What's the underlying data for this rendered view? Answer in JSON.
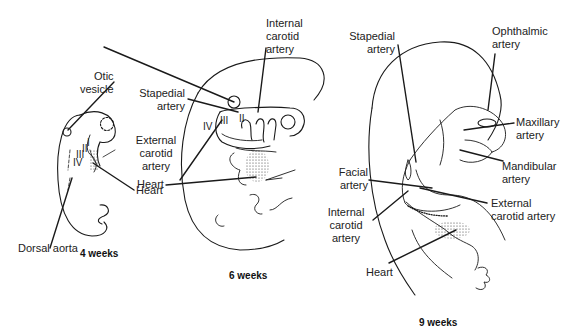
{
  "panels": [
    {
      "id": "4w",
      "caption": "4 weeks",
      "labels": {
        "otic_vesicle": [
          "Otic",
          "vesicle"
        ],
        "dorsal_aorta": "Dorsal aorta",
        "heart": "Heart"
      },
      "arch_numerals": [
        "I",
        "II",
        "III",
        "IV"
      ]
    },
    {
      "id": "6w",
      "caption": "6 weeks",
      "labels": {
        "internal_carotid": [
          "Internal",
          "carotid",
          "artery"
        ],
        "stapedial": [
          "Stapedial",
          "artery"
        ],
        "external_carotid": [
          "External",
          "carotid",
          "artery"
        ],
        "heart": "Heart"
      },
      "arch_numerals": [
        "II",
        "III",
        "IV"
      ]
    },
    {
      "id": "9w",
      "caption": "9 weeks",
      "labels": {
        "stapedial": [
          "Stapedial",
          "artery"
        ],
        "ophthalmic": [
          "Ophthalmic",
          "artery"
        ],
        "maxillary": [
          "Maxillary",
          "artery"
        ],
        "facial": [
          "Facial",
          "artery"
        ],
        "mandibular": [
          "Mandibular",
          "artery"
        ],
        "external_carotid": [
          "External",
          "carotid artery"
        ],
        "internal_carotid": [
          "Internal",
          "carotid",
          "artery"
        ],
        "heart": "Heart"
      }
    }
  ]
}
